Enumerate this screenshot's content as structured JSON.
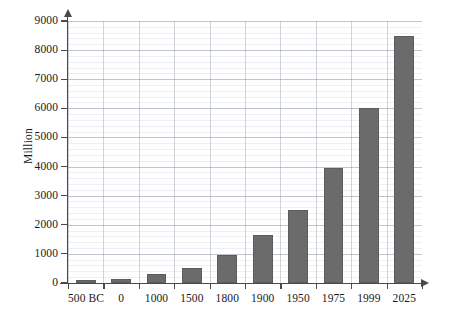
{
  "chart_data": {
    "type": "bar",
    "title": "",
    "subtitle": "",
    "xlabel": "",
    "ylabel": "Million",
    "categories": [
      "500 BC",
      "0",
      "1000",
      "1500",
      "1800",
      "1900",
      "1950",
      "1975",
      "1999",
      "2025"
    ],
    "values": [
      100,
      150,
      310,
      500,
      950,
      1650,
      2500,
      3950,
      6000,
      8500
    ],
    "ylim": [
      0,
      9000
    ],
    "ytick_values": [
      0,
      1000,
      2000,
      3000,
      4000,
      5000,
      6000,
      7000,
      8000,
      9000
    ],
    "ytick_labels": [
      "0",
      "1000",
      "2000",
      "3000",
      "4000",
      "5000",
      "6000",
      "7000",
      "8000",
      "9000"
    ],
    "grid": true,
    "grid_orientation": "both",
    "legend": false,
    "legend_position": "none",
    "series": [
      {
        "name": "World population",
        "values": [
          100,
          150,
          310,
          500,
          950,
          1650,
          2500,
          3950,
          6000,
          8500
        ]
      }
    ],
    "bar_color": "#6b6b6b",
    "axis_color": "#4a4a4a",
    "grid_color": "#b6bdcc",
    "background_color": "#ffffff"
  }
}
